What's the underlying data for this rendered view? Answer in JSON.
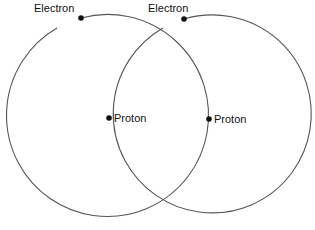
{
  "diagram": {
    "type": "two overlapping atomic orbits",
    "colors": {
      "orbit": "#555555",
      "dot": "#111111",
      "text": "#111111",
      "background": "#ffffff"
    },
    "atoms": [
      {
        "id": "left",
        "orbit": {
          "cx": 108,
          "cy": 118,
          "r": 101,
          "gap_from": [
            57,
            27
          ],
          "gap_to": [
            81,
            18
          ]
        },
        "electron": {
          "label": "Electron",
          "x": 81,
          "y": 18
        },
        "proton": {
          "label": "Proton",
          "x": 209,
          "y": 119
        }
      },
      {
        "id": "right",
        "orbit": {
          "cx": 207,
          "cy": 118,
          "r": 99,
          "gap_from": [
            163,
            27
          ],
          "gap_to": [
            184,
            19
          ]
        },
        "electron": {
          "label": "Electron",
          "x": 184,
          "y": 19
        },
        "proton": {
          "label": "Proton",
          "x": 109,
          "y": 118
        }
      }
    ]
  }
}
